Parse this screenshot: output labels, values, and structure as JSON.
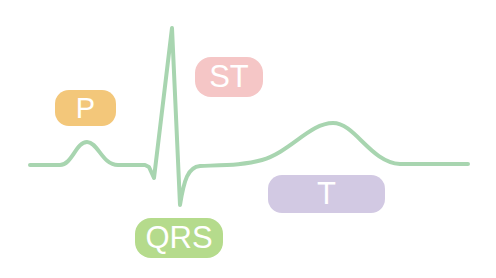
{
  "diagram": {
    "type": "ecg-waveform",
    "colors": {
      "trace": "#a8d5b0",
      "p_badge": "#f3c77a",
      "st_badge": "#f5c6c6",
      "qrs_badge": "#b5db8c",
      "t_badge": "#d2c9e3",
      "label_text": "#ffffff"
    },
    "labels": {
      "p": "P",
      "st": "ST",
      "qrs": "QRS",
      "t": "T"
    }
  }
}
